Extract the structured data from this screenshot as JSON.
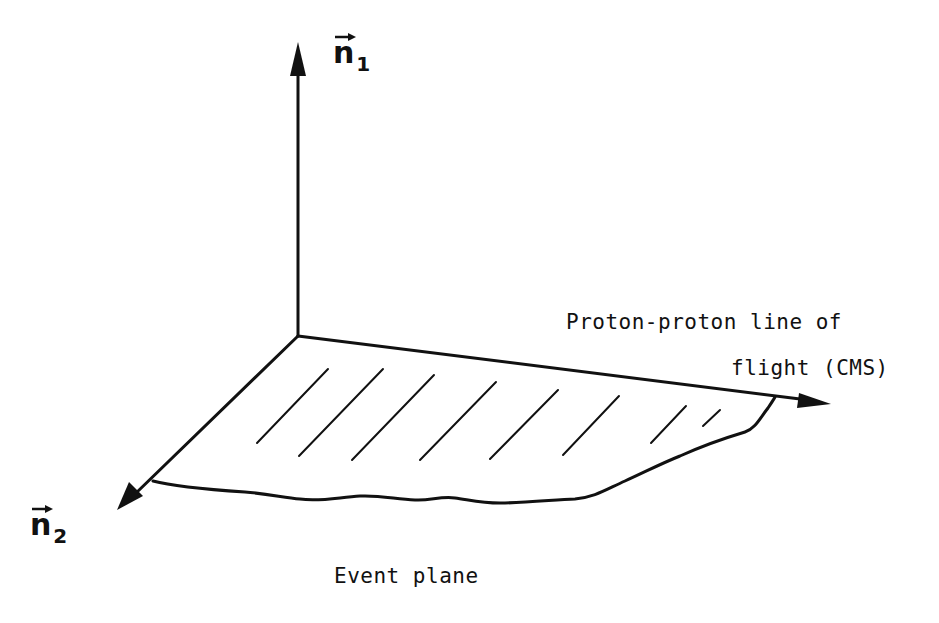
{
  "diagram": {
    "axes": {
      "n1": {
        "symbol": "n",
        "subscript": "1",
        "direction": "up"
      },
      "n2": {
        "symbol": "n",
        "subscript": "2",
        "direction": "down-left"
      },
      "beam": {
        "direction": "right",
        "label_line1": "Proton-proton line of",
        "label_line2": "flight (CMS)"
      }
    },
    "plane": {
      "label": "Event plane",
      "hatch_count": 8
    },
    "colors": {
      "ink": "#111111",
      "background": "#ffffff"
    }
  }
}
